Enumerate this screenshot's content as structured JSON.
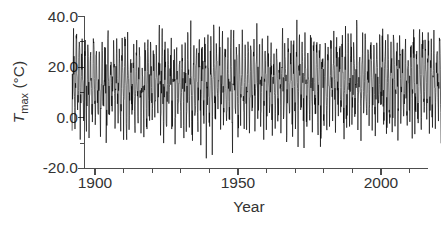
{
  "chart_data": {
    "type": "line",
    "title": "",
    "subtitle": "",
    "xlabel": "Year",
    "ylabel": "T_max (°C)",
    "ylabel_parts": {
      "symbol": "T",
      "subscript": "max",
      "units": "(°C)"
    },
    "xlim": [
      1892,
      2021
    ],
    "ylim": [
      -20.0,
      40.0
    ],
    "grid": false,
    "legend": null,
    "x_ticks_major": [
      1900,
      1950,
      2000
    ],
    "x_tick_labels": [
      "1900",
      "1950",
      "2000"
    ],
    "x_ticks_minor": [
      1910,
      1920,
      1930,
      1940,
      1960,
      1970,
      1980,
      1990,
      2010,
      2020
    ],
    "y_ticks_major": [
      40.0,
      20.0,
      0.0,
      -20.0
    ],
    "y_tick_labels": [
      "40.0",
      "20.0",
      "0.0",
      "-20.0"
    ],
    "y_ticks_minor": [
      30.0,
      10.0,
      -10.0
    ],
    "series": [
      {
        "name": "Monthly maximum temperature",
        "color": "#000000",
        "sampling": "monthly",
        "x_start": 1892,
        "x_end": 2021,
        "points_per_year": 12,
        "seasonal_mean": 13.5,
        "seasonal_amplitude": 13.0,
        "seasonal_phase_peak_month": 7,
        "noise_sigma": 4.2,
        "trend_per_century": 1.2,
        "observed_max": 39.0,
        "observed_min": -16.5,
        "description": "Dense oscillating monthly maximum temperature record from 1892 to 2021 showing strong annual seasonal cycle with peaks near 30-39 °C and troughs near -5 to -16 °C, centered about 13-15 °C."
      }
    ]
  },
  "axes": {
    "x_axis_name": "year-axis",
    "y_axis_name": "temperature-axis"
  }
}
